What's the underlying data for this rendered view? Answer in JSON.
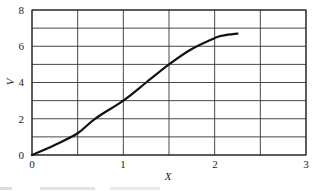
{
  "chart_data": {
    "type": "line",
    "title": "",
    "xlabel": "X",
    "ylabel": "V",
    "xlim": [
      0,
      3
    ],
    "ylim": [
      0,
      8
    ],
    "xticks": [
      0,
      1,
      2,
      3
    ],
    "yticks": [
      0,
      2,
      4,
      6,
      8
    ],
    "x_minor_gridlines": [
      0.5,
      1.5,
      2.5
    ],
    "y_minor_gridlines": [
      1,
      3,
      5,
      7
    ],
    "grid": true,
    "legend": null,
    "series": [
      {
        "name": "V vs X",
        "color": "#111111",
        "x": [
          0,
          0.25,
          0.5,
          0.69,
          1.0,
          1.25,
          1.5,
          1.75,
          2.0,
          2.1,
          2.25
        ],
        "y": [
          0,
          0.55,
          1.2,
          2.0,
          3.0,
          4.0,
          5.0,
          5.85,
          6.45,
          6.6,
          6.7
        ]
      }
    ]
  },
  "labels": {
    "x_axis": "X",
    "y_axis": "V",
    "xtick_0": "0",
    "xtick_1": "1",
    "xtick_2": "2",
    "xtick_3": "3",
    "ytick_0": "0",
    "ytick_2": "2",
    "ytick_4": "4",
    "ytick_6": "6",
    "ytick_8": "8"
  }
}
